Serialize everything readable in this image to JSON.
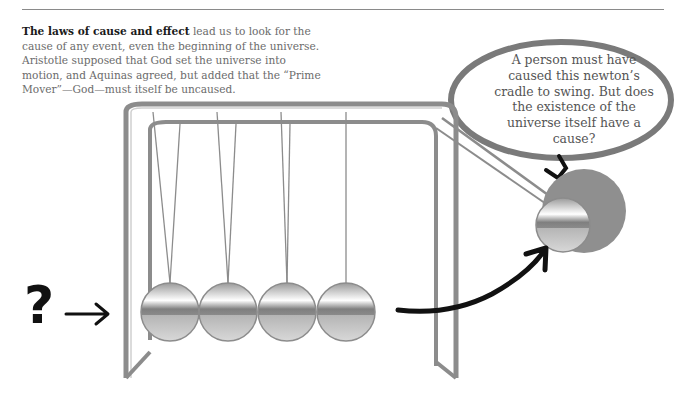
{
  "caption": {
    "lead_bold": "The laws of cause and effect",
    "body": " lead us to look for the cause of any event, even the beginning of the universe. Aristotle supposed that God set the universe into motion, and Aquinas agreed, but added that the “Prime Mover”—God—must itself be uncaused."
  },
  "thought_bubble": {
    "text": "A person must have caused this newton’s cradle to swing. But does the existence of the universe itself have a cause?"
  },
  "illustration": {
    "question_mark": "?",
    "subject": "newtons-cradle",
    "ball_count": 4,
    "colors": {
      "ink": "#111111",
      "metal": "#8c8c8c",
      "bubble_outline": "#7a7a7a",
      "shadow": "#8f8f8f"
    }
  }
}
